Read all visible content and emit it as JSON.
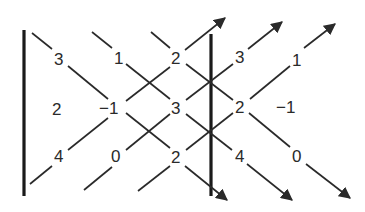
{
  "diagram": {
    "matrix": [
      [
        "3",
        "1",
        "2"
      ],
      [
        "2",
        "−1",
        "3"
      ],
      [
        "4",
        "0",
        "2"
      ]
    ],
    "repeated_columns": [
      [
        "3",
        "1"
      ],
      [
        "2",
        "−1"
      ],
      [
        "4",
        "0"
      ]
    ],
    "cells": {
      "r1c1": "3",
      "r1c2": "1",
      "r1c3": "2",
      "r1c4": "3",
      "r1c5": "1",
      "r2c1": "2",
      "r2c2": "−1",
      "r2c3": "3",
      "r2c4": "2",
      "r2c5": "−1",
      "r3c1": "4",
      "r3c2": "0",
      "r3c3": "2",
      "r3c4": "4",
      "r3c5": "0"
    },
    "arrows": {
      "down_right_count": 3,
      "up_right_count": 3
    },
    "colors": {
      "ink": "#2a2a2a",
      "background": "#ffffff"
    }
  }
}
